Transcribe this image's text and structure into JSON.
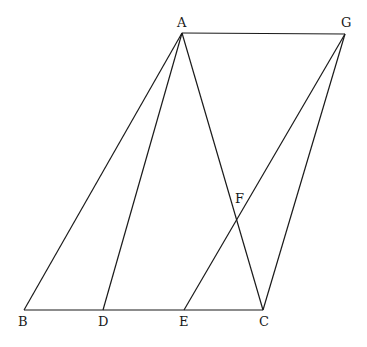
{
  "diagram": {
    "type": "geometry",
    "points": {
      "A": {
        "x": 182,
        "y": 33,
        "label": "A",
        "lx": 177,
        "ly": 27
      },
      "G": {
        "x": 345,
        "y": 34,
        "label": "G",
        "lx": 341,
        "ly": 27
      },
      "B": {
        "x": 24,
        "y": 310,
        "label": "B",
        "lx": 18,
        "ly": 326
      },
      "D": {
        "x": 103,
        "y": 310,
        "label": "D",
        "lx": 98,
        "ly": 326
      },
      "E": {
        "x": 184,
        "y": 310,
        "label": "E",
        "lx": 179,
        "ly": 326
      },
      "C": {
        "x": 263,
        "y": 310,
        "label": "C",
        "lx": 259,
        "ly": 326
      },
      "F": {
        "x": 237,
        "y": 218,
        "label": "F",
        "lx": 235,
        "ly": 203
      }
    },
    "segments": [
      [
        "A",
        "G"
      ],
      [
        "A",
        "B"
      ],
      [
        "A",
        "D"
      ],
      [
        "A",
        "C"
      ],
      [
        "B",
        "C"
      ],
      [
        "G",
        "E"
      ],
      [
        "G",
        "C"
      ]
    ]
  }
}
